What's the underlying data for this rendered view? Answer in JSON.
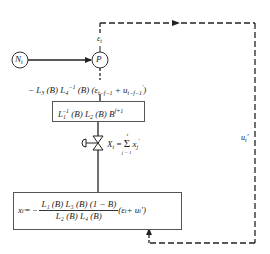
{
  "nodes": {
    "N": {
      "label": "N",
      "subscript": "t"
    },
    "P": {
      "label": "P"
    }
  },
  "labels": {
    "epsilon": {
      "symbol": "ε",
      "subscript": "t"
    },
    "u_feedback": {
      "symbol": "u",
      "subscript": "t",
      "prime": "′"
    }
  },
  "equations": {
    "feedforward": {
      "prefix": "− L",
      "l3_sub": "3",
      "b1": " (B) L",
      "l4_sub": "4",
      "inv": "−1",
      "b2": " (B) (ε",
      "eps_sub": "t−f−1",
      "plus": " + u",
      "u_sub": "t−f−1",
      "u_prime": "′",
      "close": ")"
    },
    "box1": {
      "l1": "L",
      "l1_sub": "1",
      "l1_sup": "−1",
      "mid": " (B) L",
      "l2_sub": "2",
      "tail": " (B) B",
      "b_sup": "f+1"
    },
    "valve": {
      "lhs": "X",
      "lhs_sub": "t",
      "eq": " = ",
      "sigma": "Σ",
      "upper": "t",
      "lower": "j = 1",
      "term": " x",
      "term_sub": "j",
      "term_prime": "′"
    },
    "box2": {
      "lhs": "x",
      "lhs_sub": "t",
      "lhs_prime": "′",
      "eq": " = −",
      "numerator": "L₁ (B) L₃ (B) (1 − B)",
      "denominator": "L₂ (B) L₄ (B)",
      "tail_open": " (ε",
      "tail_eps_sub": "t",
      "tail_plus": " + u",
      "tail_u_sub": "t",
      "tail_close": "′)"
    }
  },
  "colors": {
    "line": "#222222",
    "box_border": "#555555",
    "background": "#ffffff"
  }
}
